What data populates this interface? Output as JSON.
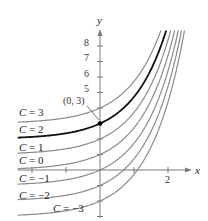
{
  "chart_data": {
    "type": "line",
    "title": "",
    "xlabel": "x",
    "ylabel": "y",
    "function": "y = e^x + C",
    "xlim": [
      -2.45,
      2.6
    ],
    "ylim": [
      -3.2,
      9
    ],
    "x_ticks": [
      -2,
      -1,
      0,
      1,
      2
    ],
    "x_tick_labels": {
      "2": "2"
    },
    "y_ticks": [
      -3,
      -2,
      -1,
      0,
      1,
      2,
      3,
      4,
      5,
      6,
      7,
      8
    ],
    "y_tick_labels": {
      "5": "5",
      "6": "6",
      "7": "7",
      "8": "8"
    },
    "grid": false,
    "series": [
      {
        "name": "C = 3",
        "C": 3,
        "highlight": false
      },
      {
        "name": "C = 2",
        "C": 2,
        "highlight": true
      },
      {
        "name": "C = 1",
        "C": 1,
        "highlight": false
      },
      {
        "name": "C = 0",
        "C": 0,
        "highlight": false
      },
      {
        "name": "C = −1",
        "C": -1,
        "highlight": false
      },
      {
        "name": "C = −2",
        "C": -2,
        "highlight": false
      },
      {
        "name": "C = −3",
        "C": -3,
        "highlight": false
      }
    ],
    "annotations": [
      {
        "text": "(0, 3)",
        "x": 0,
        "y": 3,
        "type": "point"
      }
    ]
  },
  "labels": {
    "x_axis": "x",
    "y_axis": "y",
    "point": "(0, 3)",
    "y_ticks": [
      "8",
      "7",
      "6",
      "5"
    ],
    "x_tick_2": "2"
  },
  "colors": {
    "curve": "#8a8a8a",
    "highlight": "#111111",
    "axis": "#7a7a7a"
  }
}
